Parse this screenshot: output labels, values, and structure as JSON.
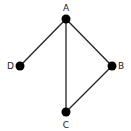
{
  "diagram": {
    "type": "undirected-graph",
    "nodes": [
      {
        "id": "A",
        "label": "A",
        "x": 66,
        "y": 19,
        "label_x": 66,
        "label_y": 11,
        "anchor": "middle"
      },
      {
        "id": "B",
        "label": "B",
        "x": 112,
        "y": 66,
        "label_x": 118,
        "label_y": 69,
        "anchor": "start"
      },
      {
        "id": "C",
        "label": "C",
        "x": 66,
        "y": 112,
        "label_x": 66,
        "label_y": 128,
        "anchor": "middle"
      },
      {
        "id": "D",
        "label": "D",
        "x": 20,
        "y": 66,
        "label_x": 14,
        "label_y": 69,
        "anchor": "end"
      }
    ],
    "edges": [
      {
        "from": "A",
        "to": "D"
      },
      {
        "from": "A",
        "to": "C"
      },
      {
        "from": "A",
        "to": "B"
      },
      {
        "from": "B",
        "to": "C"
      }
    ],
    "colors": {
      "node": "#000000",
      "edge": "#222222",
      "label": "#222222"
    }
  }
}
